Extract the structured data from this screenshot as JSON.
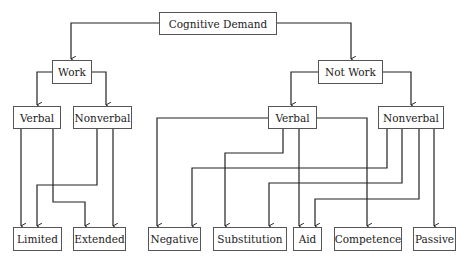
{
  "diagram": {
    "type": "tree",
    "root": {
      "id": "cognitive-demand",
      "label": "Cognitive Demand"
    },
    "nodes": {
      "cognitive_demand": "Cognitive Demand",
      "work": "Work",
      "not_work": "Not Work",
      "work_verbal": "Verbal",
      "work_nonverbal": "Nonverbal",
      "notwork_verbal": "Verbal",
      "notwork_nonverbal": "Nonverbal",
      "limited": "Limited",
      "extended": "Extended",
      "negative": "Negative",
      "substitution": "Substitution",
      "aid": "Aid",
      "competence": "Competence",
      "passive": "Passive"
    },
    "edges": [
      [
        "Cognitive Demand",
        "Work"
      ],
      [
        "Cognitive Demand",
        "Not Work"
      ],
      [
        "Work",
        "Verbal (Work)"
      ],
      [
        "Work",
        "Nonverbal (Work)"
      ],
      [
        "Not Work",
        "Verbal (Not Work)"
      ],
      [
        "Not Work",
        "Nonverbal (Not Work)"
      ],
      [
        "Verbal (Work)",
        "Limited"
      ],
      [
        "Verbal (Work)",
        "Extended"
      ],
      [
        "Nonverbal (Work)",
        "Limited"
      ],
      [
        "Nonverbal (Work)",
        "Extended"
      ],
      [
        "Verbal (Not Work)",
        "Negative"
      ],
      [
        "Verbal (Not Work)",
        "Substitution"
      ],
      [
        "Verbal (Not Work)",
        "Aid"
      ],
      [
        "Verbal (Not Work)",
        "Competence"
      ],
      [
        "Nonverbal (Not Work)",
        "Negative"
      ],
      [
        "Nonverbal (Not Work)",
        "Substitution"
      ],
      [
        "Nonverbal (Not Work)",
        "Aid"
      ],
      [
        "Nonverbal (Not Work)",
        "Passive"
      ]
    ]
  }
}
